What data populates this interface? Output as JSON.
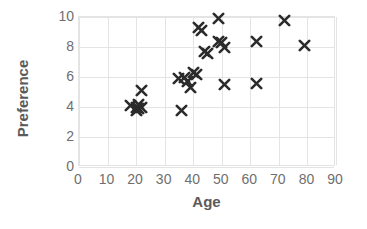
{
  "chart_data": {
    "type": "scatter",
    "title": "",
    "xlabel": "Age",
    "ylabel": "Preference",
    "xlim": [
      0,
      90
    ],
    "ylim": [
      0,
      10
    ],
    "xticks": [
      0,
      10,
      20,
      30,
      40,
      50,
      60,
      70,
      80,
      90
    ],
    "yticks": [
      0,
      2,
      4,
      6,
      8,
      10
    ],
    "grid": true,
    "legend": false,
    "marker": "x",
    "marker_color": "#2b2b2b",
    "gridline_color": "#e4e4e4",
    "axis_label_color": "#6f6f6f",
    "axis_title_color": "#5a5a5a",
    "series": [
      {
        "name": "Preference vs Age",
        "points": [
          {
            "x": 18,
            "y": 4.1
          },
          {
            "x": 20,
            "y": 4.0
          },
          {
            "x": 20,
            "y": 3.8
          },
          {
            "x": 21,
            "y": 4.2
          },
          {
            "x": 21,
            "y": 3.9
          },
          {
            "x": 22,
            "y": 4.0
          },
          {
            "x": 22,
            "y": 5.1
          },
          {
            "x": 36,
            "y": 3.8
          },
          {
            "x": 35,
            "y": 5.9
          },
          {
            "x": 37,
            "y": 6.0
          },
          {
            "x": 38,
            "y": 5.7
          },
          {
            "x": 39,
            "y": 5.3
          },
          {
            "x": 40,
            "y": 6.3
          },
          {
            "x": 41,
            "y": 6.2
          },
          {
            "x": 42,
            "y": 9.3
          },
          {
            "x": 43,
            "y": 9.1
          },
          {
            "x": 44,
            "y": 7.7
          },
          {
            "x": 45,
            "y": 7.6
          },
          {
            "x": 49,
            "y": 9.9
          },
          {
            "x": 49,
            "y": 8.4
          },
          {
            "x": 50,
            "y": 8.3
          },
          {
            "x": 51,
            "y": 8.0
          },
          {
            "x": 51,
            "y": 5.5
          },
          {
            "x": 62,
            "y": 8.4
          },
          {
            "x": 62,
            "y": 5.6
          },
          {
            "x": 72,
            "y": 9.8
          },
          {
            "x": 79,
            "y": 8.1
          }
        ]
      }
    ]
  }
}
